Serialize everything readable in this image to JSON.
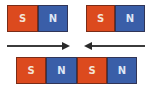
{
  "diagram": {
    "top_left_magnet": {
      "poles": [
        {
          "label": "S",
          "color": "#dc4a1e"
        },
        {
          "label": "N",
          "color": "#3a5ea8"
        }
      ]
    },
    "top_right_magnet": {
      "poles": [
        {
          "label": "S",
          "color": "#dc4a1e"
        },
        {
          "label": "N",
          "color": "#3a5ea8"
        }
      ]
    },
    "arrows": [
      {
        "direction": "right"
      },
      {
        "direction": "left"
      }
    ],
    "combined_magnet": {
      "poles": [
        {
          "label": "S"
        },
        {
          "label": "N"
        },
        {
          "label": "S"
        },
        {
          "label": "N"
        }
      ]
    }
  }
}
